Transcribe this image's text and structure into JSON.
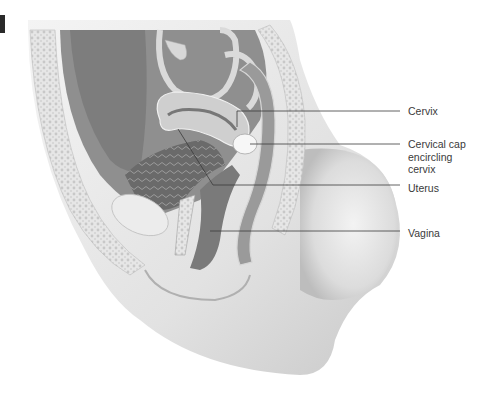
{
  "figure": {
    "type": "anatomical-illustration"
  },
  "labels": [
    {
      "id": "cervix",
      "text": "Cervix"
    },
    {
      "id": "cervical_cap",
      "text": "Cervical cap\nencircling\ncervix"
    },
    {
      "id": "uterus",
      "text": "Uterus"
    },
    {
      "id": "vagina",
      "text": "Vagina"
    }
  ],
  "colors": {
    "background": "#ffffff",
    "leader_line": "#3a3a3a",
    "label_text": "#3a3a3a"
  }
}
